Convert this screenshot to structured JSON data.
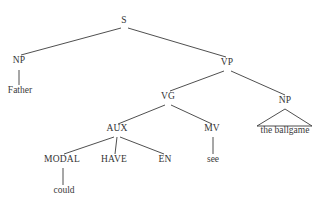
{
  "diagram": {
    "type": "constituency-parse-tree",
    "sentence": "Father could have seen the ballgame",
    "background_color": "#ffffff",
    "line_color": "#3b3b3b",
    "text_color": "#333333",
    "nodes": [
      {
        "id": "s",
        "label": "S",
        "kind": "nonterminal",
        "x": 124,
        "y": 23
      },
      {
        "id": "np1",
        "label": "NP",
        "kind": "nonterminal",
        "x": 19,
        "y": 63
      },
      {
        "id": "vp",
        "label": "VP",
        "kind": "nonterminal",
        "x": 227,
        "y": 65
      },
      {
        "id": "father",
        "label": "Father",
        "kind": "terminal",
        "x": 20,
        "y": 93
      },
      {
        "id": "vg",
        "label": "VG",
        "kind": "nonterminal",
        "x": 168,
        "y": 99
      },
      {
        "id": "np2",
        "label": "NP",
        "kind": "nonterminal",
        "x": 285,
        "y": 103
      },
      {
        "id": "aux",
        "label": "AUX",
        "kind": "nonterminal",
        "x": 117,
        "y": 131
      },
      {
        "id": "mv",
        "label": "MV",
        "kind": "nonterminal",
        "x": 212,
        "y": 131
      },
      {
        "id": "ballg",
        "label": "the ballgame",
        "kind": "terminal",
        "x": 285,
        "y": 133
      },
      {
        "id": "modal",
        "label": "MODAL",
        "kind": "nonterminal",
        "x": 62,
        "y": 162
      },
      {
        "id": "have",
        "label": "HAVE",
        "kind": "nonterminal",
        "x": 114,
        "y": 162
      },
      {
        "id": "en",
        "label": "EN",
        "kind": "nonterminal",
        "x": 165,
        "y": 162
      },
      {
        "id": "see",
        "label": "see",
        "kind": "terminal",
        "x": 213,
        "y": 162
      },
      {
        "id": "could",
        "label": "could",
        "kind": "terminal",
        "x": 64,
        "y": 193
      }
    ],
    "edges": [
      {
        "from": "s",
        "to": "np1",
        "x1": 121,
        "y1": 28,
        "x2": 21,
        "y2": 55
      },
      {
        "from": "s",
        "to": "vp",
        "x1": 128,
        "y1": 28,
        "x2": 226,
        "y2": 57
      },
      {
        "from": "np1",
        "to": "father",
        "x1": 19,
        "y1": 70,
        "x2": 19,
        "y2": 85
      },
      {
        "from": "vp",
        "to": "vg",
        "x1": 224,
        "y1": 71,
        "x2": 170,
        "y2": 91
      },
      {
        "from": "vp",
        "to": "np2",
        "x1": 231,
        "y1": 71,
        "x2": 285,
        "y2": 95
      },
      {
        "from": "vg",
        "to": "aux",
        "x1": 165,
        "y1": 105,
        "x2": 118,
        "y2": 124
      },
      {
        "from": "vg",
        "to": "mv",
        "x1": 171,
        "y1": 105,
        "x2": 212,
        "y2": 124
      },
      {
        "from": "aux",
        "to": "modal",
        "x1": 114,
        "y1": 137,
        "x2": 64,
        "y2": 154
      },
      {
        "from": "aux",
        "to": "have",
        "x1": 117,
        "y1": 137,
        "x2": 115,
        "y2": 154
      },
      {
        "from": "aux",
        "to": "en",
        "x1": 120,
        "y1": 137,
        "x2": 164,
        "y2": 154
      },
      {
        "from": "mv",
        "to": "see",
        "x1": 213,
        "y1": 137,
        "x2": 213,
        "y2": 154
      },
      {
        "from": "modal",
        "to": "could",
        "x1": 63,
        "y1": 168,
        "x2": 63,
        "y2": 185
      }
    ],
    "triangles": [
      {
        "under": "np2",
        "apex_x": 285,
        "apex_y": 109,
        "left_x": 257,
        "right_x": 312,
        "base_y": 126
      }
    ]
  }
}
